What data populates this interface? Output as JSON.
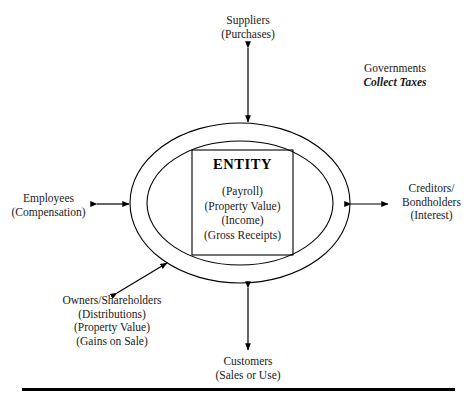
{
  "diagram": {
    "center": {
      "title": "ENTITY",
      "items": [
        "(Payroll)",
        "(Property Value)",
        "(Income)",
        "(Gross Receipts)"
      ]
    },
    "stakeholders": {
      "suppliers": {
        "name": "Suppliers",
        "detail": "(Purchases)"
      },
      "governments": {
        "name": "Governments",
        "detail": "Collect Taxes"
      },
      "employees": {
        "name": "Employees",
        "detail": "(Compensation)"
      },
      "creditors": {
        "name_line1": "Creditors/",
        "name_line2": "Bondholders",
        "detail": "(Interest)"
      },
      "owners": {
        "name": "Owners/Shareholders",
        "detail1": "(Distributions)",
        "detail2": "(Property Value)",
        "detail3": "(Gains on Sale)"
      },
      "customers": {
        "name": "Customers",
        "detail": "(Sales or Use)"
      }
    },
    "connectors": [
      "suppliers-arrow",
      "employees-arrow",
      "creditors-arrow",
      "owners-arrow",
      "customers-arrow"
    ],
    "colors": {
      "stroke": "#000000",
      "text": "#1a1a1a",
      "background": "#ffffff"
    }
  }
}
